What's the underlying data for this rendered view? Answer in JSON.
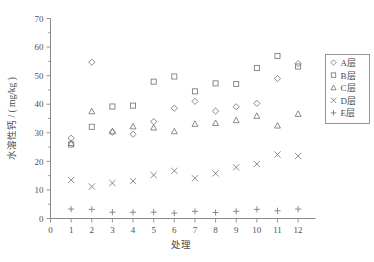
{
  "chart_data": {
    "type": "scatter",
    "title": "",
    "xlabel": "处理",
    "ylabel": "水溶性钙 / ( mg/kg )",
    "xlim": [
      0,
      12.6
    ],
    "ylim": [
      0,
      70
    ],
    "xticks": [
      0,
      1,
      2,
      3,
      4,
      5,
      6,
      7,
      8,
      9,
      10,
      11,
      12
    ],
    "yticks": [
      0,
      10,
      20,
      30,
      40,
      50,
      60,
      70
    ],
    "minor_ticks": true,
    "grid": false,
    "legend_position": "right",
    "categories": [
      1,
      2,
      3,
      4,
      5,
      6,
      7,
      8,
      9,
      10,
      11,
      12
    ],
    "series": [
      {
        "name": "A层",
        "marker": "diamond",
        "values": [
          28.1,
          54.7,
          30.2,
          29.5,
          33.9,
          38.6,
          41.0,
          37.6,
          39.1,
          40.3,
          49.0,
          54.2
        ]
      },
      {
        "name": "B层",
        "marker": "square",
        "values": [
          25.9,
          32.1,
          39.2,
          39.5,
          47.9,
          49.7,
          44.5,
          47.3,
          47.1,
          52.7,
          56.9,
          53.2
        ]
      },
      {
        "name": "C层",
        "marker": "triangle",
        "values": [
          26.4,
          37.5,
          30.5,
          32.2,
          31.8,
          30.5,
          33.1,
          33.4,
          34.4,
          35.9,
          32.5,
          36.6
        ]
      },
      {
        "name": "D层",
        "marker": "cross-x",
        "values": [
          13.5,
          11.2,
          12.4,
          13.1,
          15.2,
          16.7,
          14.1,
          15.8,
          17.9,
          19.1,
          22.4,
          21.9
        ]
      },
      {
        "name": "E层",
        "marker": "plus",
        "values": [
          3.3,
          3.2,
          2.2,
          2.2,
          2.2,
          1.9,
          2.5,
          2.1,
          2.5,
          3.2,
          2.7,
          3.3
        ]
      }
    ]
  },
  "legend": {
    "entries": [
      {
        "label": "A层",
        "marker": "diamond"
      },
      {
        "label": "B层",
        "marker": "square"
      },
      {
        "label": "C层",
        "marker": "triangle"
      },
      {
        "label": "D层",
        "marker": "cross-x"
      },
      {
        "label": "E层",
        "marker": "plus"
      }
    ]
  },
  "colors": {
    "axis": "#8a8a8a",
    "marker": "#777777",
    "text": "#4a4a4a",
    "background": "#ffffff"
  }
}
